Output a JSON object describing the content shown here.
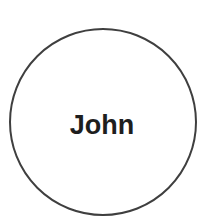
{
  "diagram": {
    "node": {
      "label": "John",
      "shape": "circle",
      "stroke_color": "#3f3f3f",
      "text_color": "#1e1e1e",
      "fill_color": "#ffffff"
    }
  }
}
